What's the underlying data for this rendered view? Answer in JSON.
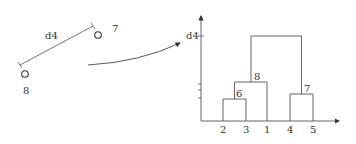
{
  "left_panel": {
    "distance_label": "d4",
    "points": [
      {
        "label": "7",
        "cx": 98,
        "cy": 35
      },
      {
        "label": "8",
        "cx": 25,
        "cy": 74
      }
    ]
  },
  "dendrogram": {
    "y_axis_label": "d4",
    "leaves": [
      "2",
      "3",
      "1",
      "4",
      "5"
    ],
    "nodes": [
      {
        "label": "6",
        "children": [
          "2",
          "3"
        ]
      },
      {
        "label": "8",
        "children": [
          "6",
          "1"
        ]
      },
      {
        "label": "7",
        "children": [
          "4",
          "5"
        ]
      },
      {
        "label": "root",
        "children": [
          "8",
          "7"
        ],
        "height_label": "d4"
      }
    ]
  },
  "colors": {
    "line": "#555555",
    "text": "#333333"
  }
}
